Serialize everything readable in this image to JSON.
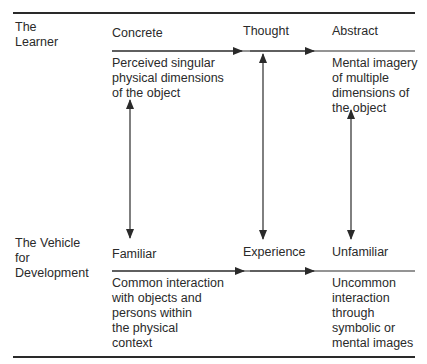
{
  "rows": {
    "learner": {
      "label": "The\nLearner",
      "headings": [
        "Concrete",
        "Thought",
        "Abstract"
      ],
      "left_description": "Perceived singular\nphysical dimensions\nof the object",
      "right_description": "Mental imagery\nof multiple\ndimensions of\nthe object"
    },
    "vehicle": {
      "label": "The Vehicle\nfor\nDevelopment",
      "headings": [
        "Familiar",
        "Experience",
        "Unfamiliar"
      ],
      "left_description": "Common interaction\nwith objects and\npersons within\nthe physical\ncontext",
      "right_description": "Uncommon\ninteraction\nthrough\nsymbolic or\nmental images"
    }
  },
  "colors": {
    "ink": "#2a2a2a",
    "background": "#ffffff"
  }
}
